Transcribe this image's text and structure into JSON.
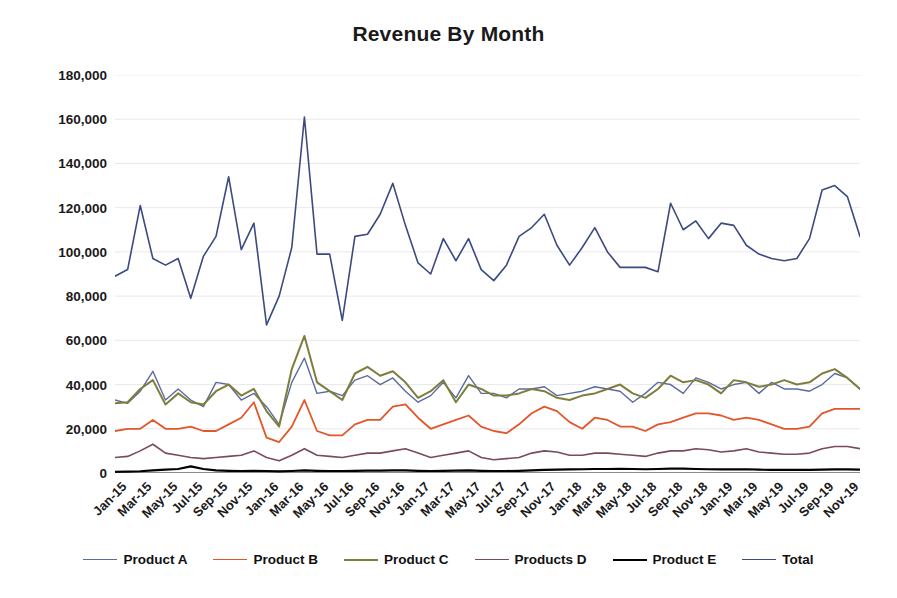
{
  "chart_data": {
    "type": "line",
    "title": "Revenue By Month",
    "xlabel": "",
    "ylabel": "",
    "ylim": [
      0,
      180000
    ],
    "ytick_step": 20000,
    "ytick_labels": [
      "0",
      "20,000",
      "40,000",
      "60,000",
      "80,000",
      "100,000",
      "120,000",
      "140,000",
      "160,000",
      "180,000"
    ],
    "ytick_values": [
      0,
      20000,
      40000,
      60000,
      80000,
      100000,
      120000,
      140000,
      160000,
      180000
    ],
    "grid": true,
    "grid_axis": "y",
    "legend_position": "bottom",
    "x": [
      "Jan-15",
      "Feb-15",
      "Mar-15",
      "Apr-15",
      "May-15",
      "Jun-15",
      "Jul-15",
      "Aug-15",
      "Sep-15",
      "Oct-15",
      "Nov-15",
      "Dec-15",
      "Jan-16",
      "Feb-16",
      "Mar-16",
      "Apr-16",
      "May-16",
      "Jun-16",
      "Jul-16",
      "Aug-16",
      "Sep-16",
      "Oct-16",
      "Nov-16",
      "Dec-16",
      "Jan-17",
      "Feb-17",
      "Mar-17",
      "Apr-17",
      "May-17",
      "Jun-17",
      "Jul-17",
      "Aug-17",
      "Sep-17",
      "Oct-17",
      "Nov-17",
      "Dec-17",
      "Jan-18",
      "Feb-18",
      "Mar-18",
      "Apr-18",
      "May-18",
      "Jun-18",
      "Jul-18",
      "Aug-18",
      "Sep-18",
      "Oct-18",
      "Nov-18",
      "Dec-18",
      "Jan-19",
      "Feb-19",
      "Mar-19",
      "Apr-19",
      "May-19",
      "Jun-19",
      "Jul-19",
      "Aug-19",
      "Sep-19",
      "Oct-19",
      "Nov-19",
      "Dec-19"
    ],
    "xtick_labels": [
      "Jan-15",
      "Mar-15",
      "May-15",
      "Jul-15",
      "Sep-15",
      "Nov-15",
      "Jan-16",
      "Mar-16",
      "May-16",
      "Jul-16",
      "Sep-16",
      "Nov-16",
      "Jan-17",
      "Mar-17",
      "May-17",
      "Jul-17",
      "Sep-17",
      "Nov-17",
      "Jan-18",
      "Mar-18",
      "May-18",
      "Jul-18",
      "Sep-18",
      "Nov-18",
      "Jan-19",
      "Mar-19",
      "May-19",
      "Jul-19",
      "Sep-19",
      "Nov-19"
    ],
    "xtick_indices": [
      0,
      2,
      4,
      6,
      8,
      10,
      12,
      14,
      16,
      18,
      20,
      22,
      24,
      26,
      28,
      30,
      32,
      34,
      36,
      38,
      40,
      42,
      44,
      46,
      48,
      50,
      52,
      54,
      56,
      58
    ],
    "series": [
      {
        "name": "Product A",
        "color": "#5b6b9e",
        "width": 1.4,
        "values": [
          33000,
          31500,
          37000,
          46000,
          33000,
          38000,
          33000,
          30000,
          41000,
          40000,
          33000,
          36000,
          30000,
          22000,
          41000,
          52000,
          36000,
          37000,
          35000,
          42000,
          44000,
          40000,
          43000,
          37000,
          32000,
          35000,
          41000,
          34000,
          44000,
          36000,
          36000,
          34000,
          38000,
          38000,
          39000,
          35000,
          36000,
          37000,
          39000,
          38000,
          37000,
          32000,
          36000,
          41000,
          40000,
          36000,
          43000,
          41000,
          38000,
          40000,
          41000,
          36000,
          41000,
          38000,
          38000,
          37000,
          40000,
          45000,
          43000,
          38000
        ]
      },
      {
        "name": "Product B",
        "color": "#e2562a",
        "width": 1.8,
        "values": [
          19000,
          20000,
          20000,
          24000,
          20000,
          20000,
          21000,
          19000,
          19000,
          22000,
          25000,
          32000,
          16000,
          14000,
          21000,
          33000,
          19000,
          17000,
          17000,
          22000,
          24000,
          24000,
          30000,
          31000,
          25000,
          20000,
          22000,
          24000,
          26000,
          21000,
          19000,
          18000,
          22000,
          27000,
          30000,
          28000,
          23000,
          20000,
          25000,
          24000,
          21000,
          21000,
          19000,
          22000,
          23000,
          25000,
          27000,
          27000,
          26000,
          24000,
          25000,
          24000,
          22000,
          20000,
          20000,
          21000,
          27000,
          29000,
          29000,
          29000
        ]
      },
      {
        "name": "Product C",
        "color": "#7d7e3c",
        "width": 2.0,
        "values": [
          31500,
          32000,
          38000,
          42000,
          31000,
          36000,
          32000,
          31000,
          37000,
          40000,
          35000,
          38000,
          28000,
          21000,
          47000,
          62000,
          41000,
          37000,
          33000,
          45000,
          48000,
          44000,
          46000,
          41000,
          34000,
          37000,
          42000,
          32000,
          40000,
          38000,
          35000,
          35000,
          36000,
          38000,
          37000,
          34000,
          33000,
          35000,
          36000,
          38000,
          40000,
          36000,
          34000,
          38000,
          44000,
          41000,
          42000,
          40000,
          36000,
          42000,
          41000,
          39000,
          40000,
          42000,
          40000,
          41000,
          45000,
          47000,
          43000,
          38000
        ]
      },
      {
        "name": "Products D",
        "color": "#7a4a5e",
        "width": 1.6,
        "values": [
          7000,
          7500,
          10000,
          13000,
          9000,
          8000,
          7000,
          6500,
          7000,
          7500,
          8000,
          10000,
          7000,
          5500,
          8000,
          11000,
          8000,
          7500,
          7000,
          8000,
          9000,
          9000,
          10000,
          11000,
          9000,
          7000,
          8000,
          9000,
          10000,
          7000,
          6000,
          6500,
          7000,
          9000,
          10000,
          9500,
          8000,
          8000,
          9000,
          9000,
          8500,
          8000,
          7500,
          9000,
          10000,
          10000,
          11000,
          10500,
          9500,
          10000,
          11000,
          9500,
          9000,
          8500,
          8500,
          9000,
          11000,
          12000,
          12000,
          11000
        ]
      },
      {
        "name": "Product E",
        "color": "#000000",
        "width": 2.2,
        "values": [
          500,
          600,
          800,
          1200,
          1500,
          1800,
          3000,
          1800,
          1200,
          1000,
          900,
          1000,
          900,
          700,
          900,
          1200,
          1000,
          900,
          900,
          1000,
          1100,
          1100,
          1200,
          1200,
          1000,
          900,
          1000,
          1100,
          1200,
          1000,
          900,
          900,
          1000,
          1200,
          1400,
          1500,
          1600,
          1700,
          1800,
          1800,
          1900,
          1800,
          1700,
          1800,
          2000,
          2000,
          1800,
          1700,
          1600,
          1600,
          1700,
          1500,
          1400,
          1400,
          1400,
          1400,
          1500,
          1600,
          1600,
          1500
        ]
      },
      {
        "name": "Total",
        "color": "#3b4a80",
        "width": 1.6,
        "values": [
          89000,
          92000,
          121000,
          97000,
          94000,
          97000,
          79000,
          98000,
          107000,
          134000,
          101000,
          113000,
          67000,
          80000,
          102000,
          161000,
          99000,
          99000,
          69000,
          107000,
          108000,
          117000,
          131000,
          112000,
          95000,
          90000,
          106000,
          96000,
          106000,
          92000,
          87000,
          94000,
          107000,
          111000,
          117000,
          103000,
          94000,
          102000,
          111000,
          100000,
          93000,
          93000,
          93000,
          91000,
          122000,
          110000,
          114000,
          106000,
          113000,
          112000,
          103000,
          99000,
          97000,
          96000,
          97000,
          106000,
          128000,
          130000,
          125000,
          107000
        ]
      }
    ]
  }
}
